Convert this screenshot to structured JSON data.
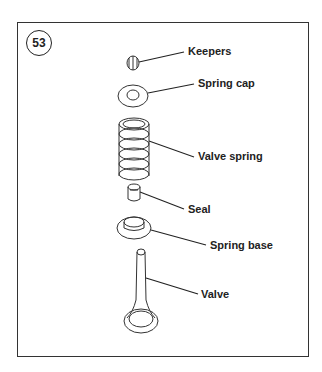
{
  "figure": {
    "number": "53",
    "labels": {
      "keepers": "Keepers",
      "spring_cap": "Spring cap",
      "valve_spring": "Valve spring",
      "seal": "Seal",
      "spring_base": "Spring base",
      "valve": "Valve"
    }
  }
}
